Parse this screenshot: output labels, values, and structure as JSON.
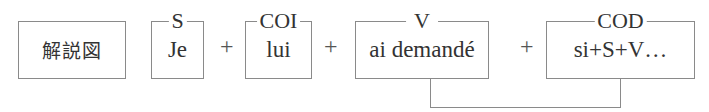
{
  "diagram": {
    "title_box": "解説図",
    "components": [
      {
        "role": "S",
        "text": "Je"
      },
      {
        "role": "COI",
        "text": "lui"
      },
      {
        "role": "V",
        "text": "ai demandé"
      },
      {
        "role": "COD",
        "text": "si+S+V…"
      }
    ],
    "operator": "+",
    "connector": {
      "from": "V",
      "to": "COD"
    }
  }
}
